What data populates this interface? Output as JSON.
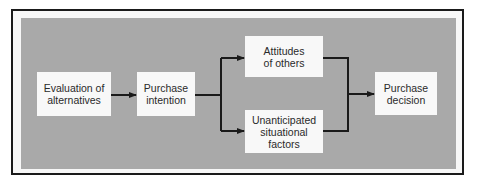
{
  "diagram": {
    "nodes": [
      {
        "id": "evaluation",
        "label": "Evaluation of\nalternatives"
      },
      {
        "id": "intention",
        "label": "Purchase\nintention"
      },
      {
        "id": "attitudes",
        "label": "Attitudes\nof others"
      },
      {
        "id": "situational",
        "label": "Unanticipated\nsituational\nfactors"
      },
      {
        "id": "decision",
        "label": "Purchase\ndecision"
      }
    ],
    "edges": [
      {
        "from": "evaluation",
        "to": "intention"
      },
      {
        "from": "intention",
        "to": "attitudes"
      },
      {
        "from": "intention",
        "to": "situational"
      },
      {
        "from": "attitudes",
        "to": "decision"
      },
      {
        "from": "situational",
        "to": "decision"
      }
    ],
    "colors": {
      "panel": "#a9a9a9",
      "box": "#f8f8f8",
      "line": "#1a1a1a"
    }
  }
}
